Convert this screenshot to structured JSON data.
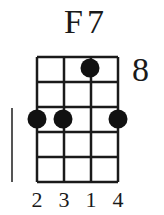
{
  "chord": {
    "name": "F7",
    "start_fret": "8",
    "strings": 4,
    "frets": 5,
    "dots": [
      {
        "string": 3,
        "fret": 1
      },
      {
        "string": 1,
        "fret": 3
      },
      {
        "string": 2,
        "fret": 3
      },
      {
        "string": 4,
        "fret": 3
      }
    ],
    "fingers": [
      "2",
      "3",
      "1",
      "4"
    ]
  }
}
